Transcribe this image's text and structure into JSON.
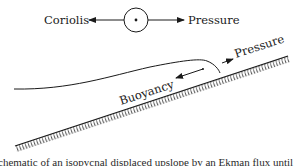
{
  "diagram": {
    "top_force_balance": {
      "left_label": "Coriolis",
      "right_label": "Pressure",
      "center_symbol": "out-of-page-vector-icon"
    },
    "slope_forces": {
      "upslope_label": "Pressure",
      "downslope_label": "Buoyancy"
    },
    "caption": "chematic of an isopycnal displaced upslope by an Ekman flux until",
    "colors": {
      "ink": "#1a1a1a",
      "background": "#ffffff"
    }
  }
}
